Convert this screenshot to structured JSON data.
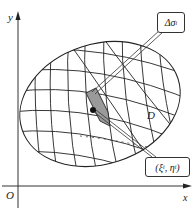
{
  "figure": {
    "type": "region-partition-diagram",
    "colors": {
      "stroke": "#222222",
      "shaded_cell": "#9a9a9a",
      "background": "#ffffff"
    }
  },
  "axes": {
    "x_label": "x",
    "y_label": "y",
    "origin_label": "O"
  },
  "region": {
    "label": "D"
  },
  "callouts": {
    "area_element": {
      "symbol": "Δσ",
      "subscript": "i"
    },
    "sample_point": {
      "open": "(",
      "xi": "ξ",
      "xi_sub": "i",
      "sep": ", ",
      "eta": "η",
      "eta_sub": "i",
      "close": ")"
    }
  }
}
